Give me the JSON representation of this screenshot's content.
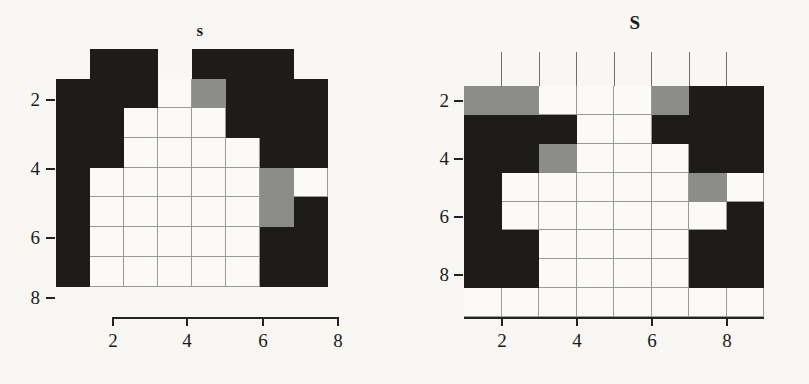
{
  "figure": {
    "background_color": "#f8f7f4",
    "cell_colors": {
      "black": "#1d1c1b",
      "gray": "#8c8c8a",
      "white": "#fbfaf8"
    },
    "grid_line_color": "#9a9a98",
    "axis_color": "#232323"
  },
  "panels": [
    {
      "id": "left",
      "title": "s",
      "xlabel": "",
      "ylabel": "",
      "x_ticks": [
        "2",
        "4",
        "6",
        "8"
      ],
      "y_ticks": [
        "2",
        "4",
        "6",
        "8"
      ],
      "grid_cols": 9,
      "grid_rows": 9
    },
    {
      "id": "right",
      "title": "S",
      "xlabel": "",
      "ylabel": "",
      "x_ticks": [
        "2",
        "4",
        "6",
        "8"
      ],
      "y_ticks": [
        "2",
        "4",
        "6",
        "8"
      ],
      "grid_cols": 8,
      "grid_rows": 8
    }
  ],
  "chart_data": [
    {
      "type": "heatmap",
      "title": "s",
      "xlabel": "",
      "ylabel": "",
      "x_tick_labels": [
        "2",
        "4",
        "6",
        "8"
      ],
      "y_tick_labels": [
        "2",
        "4",
        "6",
        "8"
      ],
      "xlim": [
        0.5,
        9.5
      ],
      "ylim": [
        0.5,
        9.5
      ],
      "grid": true,
      "legend": "none",
      "value_levels": {
        "0": "white",
        "1": "gray",
        "2": "black"
      },
      "rows": 9,
      "cols": 9,
      "matrix": [
        [
          -1,
          2,
          2,
          -1,
          2,
          2,
          2,
          -1,
          -1
        ],
        [
          2,
          2,
          2,
          0,
          1,
          2,
          2,
          2,
          -1
        ],
        [
          2,
          2,
          0,
          0,
          0,
          2,
          2,
          2,
          -1
        ],
        [
          2,
          2,
          0,
          0,
          0,
          0,
          2,
          2,
          -1
        ],
        [
          2,
          0,
          0,
          0,
          0,
          0,
          1,
          0,
          -1
        ],
        [
          2,
          0,
          0,
          0,
          0,
          0,
          1,
          2,
          -1
        ],
        [
          2,
          0,
          0,
          0,
          0,
          0,
          2,
          2,
          -1
        ],
        [
          2,
          0,
          0,
          0,
          0,
          0,
          2,
          2,
          -1
        ],
        [
          -1,
          -1,
          -1,
          -1,
          -1,
          -1,
          -1,
          -1,
          -1
        ]
      ]
    },
    {
      "type": "heatmap",
      "title": "S",
      "xlabel": "",
      "ylabel": "",
      "x_tick_labels": [
        "2",
        "4",
        "6",
        "8"
      ],
      "y_tick_labels": [
        "2",
        "4",
        "6",
        "8"
      ],
      "xlim": [
        0.5,
        8.5
      ],
      "ylim": [
        0.5,
        8.5
      ],
      "grid": true,
      "legend": "none",
      "value_levels": {
        "0": "white",
        "1": "gray",
        "2": "black"
      },
      "rows": 8,
      "cols": 8,
      "matrix": [
        [
          1,
          1,
          0,
          0,
          0,
          1,
          2,
          2
        ],
        [
          2,
          2,
          2,
          0,
          0,
          2,
          2,
          2
        ],
        [
          2,
          2,
          1,
          0,
          0,
          0,
          2,
          2
        ],
        [
          2,
          0,
          0,
          0,
          0,
          0,
          1,
          0
        ],
        [
          2,
          0,
          0,
          0,
          0,
          0,
          0,
          2
        ],
        [
          2,
          2,
          0,
          0,
          0,
          0,
          2,
          2
        ],
        [
          2,
          2,
          0,
          0,
          0,
          0,
          2,
          2
        ],
        [
          0,
          0,
          0,
          0,
          0,
          0,
          0,
          0
        ]
      ]
    }
  ]
}
